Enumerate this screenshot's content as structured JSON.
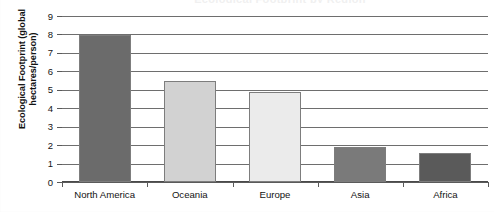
{
  "chart_data": {
    "type": "bar",
    "title": "Ecological Footprint by Region",
    "title_visible": false,
    "categories": [
      "North America",
      "Oceania",
      "Europe",
      "Asia",
      "Africa"
    ],
    "values": [
      8.0,
      5.5,
      4.9,
      1.9,
      1.6
    ],
    "bar_colors": [
      "#6b6b6b",
      "#d2d2d2",
      "#ebebeb",
      "#7a7a7a",
      "#5a5a5a"
    ],
    "xlabel": "",
    "ylabel": "Ecological Footprint (global hectares/person)",
    "ylim": [
      0,
      9
    ],
    "yticks": [
      0,
      1,
      2,
      3,
      4,
      5,
      6,
      7,
      8,
      9
    ],
    "ytick_labels": [
      "0",
      "1",
      "2",
      "3",
      "4",
      "5",
      "6",
      "7",
      "8",
      "9"
    ],
    "grid": true,
    "grid_axis": "y",
    "legend": false,
    "legend_position": "none",
    "bar_outline_color": "#7d7d7d",
    "axis_color": "#5a5a5a",
    "gridline_color": "#6e6e6e",
    "background_color": "#ffffff"
  },
  "axes": {
    "y_title": "Ecological Footprint (global hectares/person)",
    "y_title_line1": "Ecological Footprint (global",
    "y_title_line2": "hectares/person)"
  }
}
